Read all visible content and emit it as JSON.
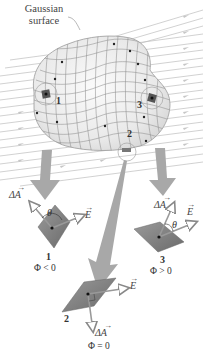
{
  "figure": {
    "surface_label_line1": "Gaussian",
    "surface_label_line2": "surface",
    "field_symbol": "E",
    "area_symbol": "ΔA",
    "angle_symbol": "θ",
    "colors": {
      "field_lines": "#b9b9b9",
      "surface_fill": "#ececec",
      "surface_grid": "#8a8a8a",
      "big_arrows": "#a6a6a6",
      "patch_fill": "#7d7d7d",
      "text": "#333333"
    },
    "patches": [
      {
        "id": "1",
        "label": "1",
        "flux": "Φ < 0"
      },
      {
        "id": "2",
        "label": "2",
        "flux": "Φ = 0"
      },
      {
        "id": "3",
        "label": "3",
        "flux": "Φ > 0"
      }
    ]
  }
}
